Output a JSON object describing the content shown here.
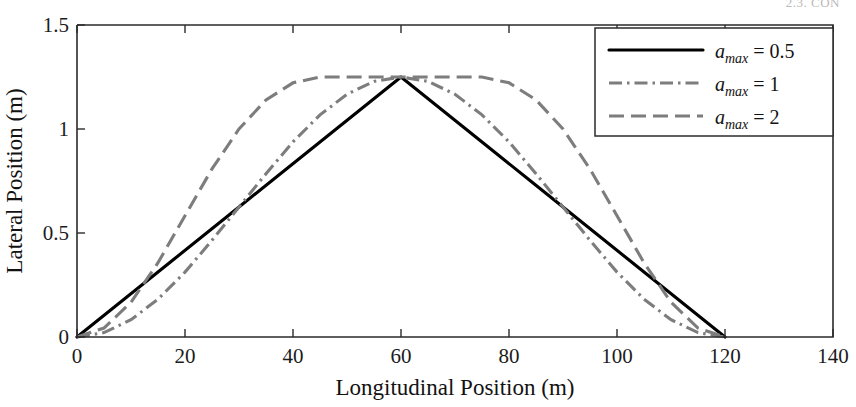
{
  "page": {
    "running_header": "2.3. CON"
  },
  "chart_data": {
    "type": "line",
    "title": "",
    "xlabel": "Longitudinal Position (m)",
    "ylabel": "Lateral Position (m)",
    "xlim": [
      0,
      140
    ],
    "ylim": [
      0,
      1.5
    ],
    "xticks": [
      0,
      20,
      40,
      60,
      80,
      100,
      120,
      140
    ],
    "xticklabels": [
      "0",
      "20",
      "40",
      "60",
      "80",
      "100",
      "120",
      "140"
    ],
    "yticks": [
      0,
      0.5,
      1,
      1.5
    ],
    "yticklabels": [
      "0",
      "0.5",
      "1",
      "1.5"
    ],
    "grid": false,
    "legend_position": "upper right",
    "peak_x": 60,
    "peak_y": 1.25,
    "end_x": 120,
    "series": [
      {
        "name": "a_max = 0.5",
        "legend_var": "a",
        "legend_sub": "max",
        "legend_value": "= 0.5",
        "style": "solid",
        "color": "#000000",
        "x": [
          0,
          6,
          12,
          18,
          24,
          30,
          36,
          42,
          48,
          54,
          60,
          66,
          72,
          78,
          84,
          90,
          96,
          102,
          108,
          114,
          120
        ],
        "y": [
          0,
          0.125,
          0.25,
          0.375,
          0.5,
          0.625,
          0.75,
          0.875,
          1.0,
          1.125,
          1.25,
          1.125,
          1.0,
          0.875,
          0.75,
          0.625,
          0.5,
          0.375,
          0.25,
          0.125,
          0
        ]
      },
      {
        "name": "a_max = 1",
        "legend_var": "a",
        "legend_sub": "max",
        "legend_value": "= 1",
        "style": "dashdot",
        "color": "#7d7d7d",
        "x": [
          0,
          5,
          10,
          15,
          20,
          25,
          30,
          35,
          40,
          45,
          50,
          55,
          60,
          65,
          70,
          75,
          80,
          85,
          90,
          95,
          100,
          105,
          110,
          115,
          120
        ],
        "y": [
          0,
          0.021,
          0.083,
          0.182,
          0.312,
          0.465,
          0.625,
          0.785,
          0.938,
          1.068,
          1.167,
          1.229,
          1.25,
          1.229,
          1.167,
          1.068,
          0.938,
          0.785,
          0.625,
          0.465,
          0.312,
          0.182,
          0.083,
          0.021,
          0
        ]
      },
      {
        "name": "a_max = 2",
        "legend_var": "a",
        "legend_sub": "max",
        "legend_value": "= 2",
        "style": "dashed",
        "color": "#7d7d7d",
        "x": [
          0,
          5,
          10,
          15,
          20,
          25,
          30,
          35,
          40,
          45,
          50,
          55,
          60,
          65,
          70,
          75,
          80,
          85,
          90,
          95,
          100,
          105,
          110,
          115,
          120
        ],
        "y": [
          0,
          0.043,
          0.167,
          0.357,
          0.583,
          0.808,
          1.0,
          1.14,
          1.222,
          1.25,
          1.25,
          1.25,
          1.25,
          1.25,
          1.25,
          1.25,
          1.222,
          1.14,
          1.0,
          0.808,
          0.583,
          0.357,
          0.167,
          0.043,
          0
        ]
      }
    ]
  },
  "legend": {
    "entries": [
      {
        "label": "a_max = 0.5",
        "style": "solid"
      },
      {
        "label": "a_max = 1",
        "style": "dashdot"
      },
      {
        "label": "a_max = 2",
        "style": "dashed"
      }
    ]
  }
}
